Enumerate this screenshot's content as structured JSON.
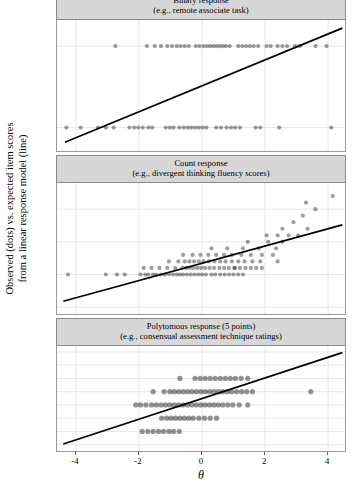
{
  "figure": {
    "ylabel": "Observed (dots) vs. expected item scores\nfrom a linear response model (line)",
    "xlabel": "θ"
  },
  "chart_data": [
    {
      "type": "scatter",
      "title": "Binary response",
      "subtitle": "(e.g., remote associate task)",
      "xlabel": "θ",
      "ylabel": "Observed (dots) vs. expected item scores from a linear response model (line)",
      "xlim": [
        -4.6,
        4.6
      ],
      "ylim": [
        -0.3,
        1.32
      ],
      "xticks": [
        -4,
        -2,
        0,
        2,
        4
      ],
      "yticks": [
        0,
        1
      ],
      "grid": true,
      "legend": "none",
      "line": {
        "name": "linear response model",
        "x": [
          -4.35,
          4.45
        ],
        "y": [
          -0.18,
          1.22
        ],
        "color": "#000000"
      },
      "points": [
        [
          -4.3,
          0
        ],
        [
          -3.85,
          0
        ],
        [
          -3.3,
          0
        ],
        [
          -3.05,
          0
        ],
        [
          -2.8,
          0
        ],
        [
          -2.3,
          0
        ],
        [
          -2.15,
          0
        ],
        [
          -2.02,
          0
        ],
        [
          -1.88,
          0
        ],
        [
          -1.7,
          0
        ],
        [
          -1.58,
          0
        ],
        [
          -1.15,
          0
        ],
        [
          -1.02,
          0
        ],
        [
          -0.9,
          0
        ],
        [
          -0.72,
          0
        ],
        [
          -0.58,
          0
        ],
        [
          -0.45,
          0
        ],
        [
          -0.34,
          0
        ],
        [
          -0.22,
          0
        ],
        [
          -0.1,
          0
        ],
        [
          0.02,
          0
        ],
        [
          0.14,
          0
        ],
        [
          0.45,
          0
        ],
        [
          0.6,
          0
        ],
        [
          0.78,
          0
        ],
        [
          0.92,
          0
        ],
        [
          1.05,
          0
        ],
        [
          1.2,
          0
        ],
        [
          1.7,
          0
        ],
        [
          1.85,
          0
        ],
        [
          2.45,
          0
        ],
        [
          4.1,
          0
        ],
        [
          -2.75,
          1
        ],
        [
          -1.75,
          1
        ],
        [
          -1.5,
          1
        ],
        [
          -1.3,
          1
        ],
        [
          -1.1,
          1
        ],
        [
          -0.95,
          1
        ],
        [
          -0.8,
          1
        ],
        [
          -0.68,
          1
        ],
        [
          -0.55,
          1
        ],
        [
          -0.42,
          1
        ],
        [
          -0.2,
          1
        ],
        [
          -0.08,
          1
        ],
        [
          0.05,
          1
        ],
        [
          0.16,
          1
        ],
        [
          0.26,
          1
        ],
        [
          0.36,
          1
        ],
        [
          0.46,
          1
        ],
        [
          0.56,
          1
        ],
        [
          0.66,
          1
        ],
        [
          0.76,
          1
        ],
        [
          0.88,
          1
        ],
        [
          1.15,
          1
        ],
        [
          1.28,
          1
        ],
        [
          1.4,
          1
        ],
        [
          1.52,
          1
        ],
        [
          1.64,
          1
        ],
        [
          1.78,
          1
        ],
        [
          2.05,
          1
        ],
        [
          2.18,
          1
        ],
        [
          2.4,
          1
        ],
        [
          2.55,
          1
        ],
        [
          2.7,
          1
        ],
        [
          2.95,
          1
        ],
        [
          3.1,
          1
        ],
        [
          3.6,
          1
        ],
        [
          3.95,
          1
        ]
      ]
    },
    {
      "type": "scatter",
      "title": "Count response",
      "subtitle": "(e.g., divergent thinking fluency scores)",
      "xlabel": "θ",
      "ylabel": "Observed (dots) vs. expected item scores from a linear response model (line)",
      "xlim": [
        -4.6,
        4.6
      ],
      "ylim": [
        -6.2,
        14.0
      ],
      "xticks": [
        -4,
        -2,
        0,
        2,
        4
      ],
      "yticks": [
        -5,
        0,
        5,
        10
      ],
      "grid": true,
      "legend": "none",
      "line": {
        "name": "linear response model",
        "x": [
          -4.4,
          4.45
        ],
        "y": [
          -4.1,
          7.6
        ],
        "color": "#000000"
      },
      "points": [
        [
          -4.25,
          0
        ],
        [
          -3.05,
          0
        ],
        [
          -2.7,
          0
        ],
        [
          -2.45,
          0
        ],
        [
          -1.95,
          0
        ],
        [
          -1.8,
          0
        ],
        [
          -1.7,
          0
        ],
        [
          -1.55,
          0
        ],
        [
          -1.45,
          0
        ],
        [
          -1.3,
          0
        ],
        [
          -1.18,
          0
        ],
        [
          -1.05,
          0
        ],
        [
          -0.92,
          0
        ],
        [
          -0.8,
          0
        ],
        [
          -0.7,
          0
        ],
        [
          -0.6,
          0
        ],
        [
          -0.48,
          0
        ],
        [
          -0.36,
          0
        ],
        [
          -0.24,
          0
        ],
        [
          -0.12,
          0
        ],
        [
          0.0,
          0
        ],
        [
          0.12,
          0
        ],
        [
          0.3,
          0
        ],
        [
          0.42,
          0
        ],
        [
          0.58,
          0
        ],
        [
          0.72,
          0
        ],
        [
          0.86,
          0
        ],
        [
          1.0,
          0
        ],
        [
          1.15,
          0
        ],
        [
          1.3,
          0
        ],
        [
          -1.85,
          1
        ],
        [
          -1.6,
          1
        ],
        [
          -1.35,
          1
        ],
        [
          -1.1,
          1
        ],
        [
          -0.85,
          1
        ],
        [
          -0.62,
          1
        ],
        [
          -0.5,
          1
        ],
        [
          -0.38,
          1
        ],
        [
          -0.26,
          1
        ],
        [
          -0.14,
          1
        ],
        [
          -0.02,
          1
        ],
        [
          0.1,
          1
        ],
        [
          0.24,
          1
        ],
        [
          0.38,
          1
        ],
        [
          0.55,
          1
        ],
        [
          0.7,
          1
        ],
        [
          0.85,
          1
        ],
        [
          1.02,
          1
        ],
        [
          1.2,
          1
        ],
        [
          1.38,
          1
        ],
        [
          1.55,
          1
        ],
        [
          1.72,
          1
        ],
        [
          1.9,
          1
        ],
        [
          -1.05,
          2
        ],
        [
          -0.75,
          2
        ],
        [
          -0.55,
          2
        ],
        [
          -0.4,
          2
        ],
        [
          -0.25,
          2
        ],
        [
          -0.1,
          2
        ],
        [
          0.05,
          2
        ],
        [
          0.22,
          2
        ],
        [
          0.4,
          2
        ],
        [
          0.58,
          2
        ],
        [
          0.75,
          2
        ],
        [
          0.95,
          2
        ],
        [
          1.15,
          2
        ],
        [
          1.35,
          2
        ],
        [
          1.6,
          2
        ],
        [
          1.85,
          2
        ],
        [
          -0.6,
          3
        ],
        [
          -0.3,
          3
        ],
        [
          -0.05,
          3
        ],
        [
          0.2,
          3
        ],
        [
          0.45,
          3
        ],
        [
          0.7,
          3
        ],
        [
          0.95,
          3
        ],
        [
          1.25,
          3
        ],
        [
          1.55,
          3
        ],
        [
          1.9,
          3
        ],
        [
          2.25,
          3
        ],
        [
          0.3,
          4
        ],
        [
          0.8,
          4
        ],
        [
          1.3,
          4
        ],
        [
          1.8,
          4
        ],
        [
          2.35,
          4
        ],
        [
          1.45,
          5
        ],
        [
          2.1,
          5
        ],
        [
          2.55,
          5
        ],
        [
          2.05,
          6
        ],
        [
          2.4,
          6
        ],
        [
          2.75,
          6
        ],
        [
          3.05,
          6
        ],
        [
          2.55,
          7
        ],
        [
          3.35,
          7
        ],
        [
          2.9,
          8
        ],
        [
          3.2,
          9
        ],
        [
          3.6,
          10
        ],
        [
          3.3,
          11
        ],
        [
          4.15,
          12
        ],
        [
          2.4,
          2
        ],
        [
          1.05,
          1
        ]
      ]
    },
    {
      "type": "scatter",
      "title": "Polytomous response (5 points)",
      "subtitle": "(e.g., consensual assessment technique ratings)",
      "xlabel": "θ",
      "ylabel": "Observed (dots) vs. expected item scores from a linear response model (line)",
      "xlim": [
        -4.6,
        4.6
      ],
      "ylim": [
        -0.55,
        7.45
      ],
      "xticks": [
        -4,
        -2,
        0,
        2,
        4
      ],
      "yticks": [
        0,
        1,
        2,
        3,
        4,
        5,
        6,
        7
      ],
      "grid": true,
      "legend": "none",
      "line": {
        "name": "linear response model",
        "x": [
          -4.4,
          4.45
        ],
        "y": [
          0.05,
          6.95
        ],
        "color": "#000000"
      },
      "points": [
        [
          -1.9,
          1
        ],
        [
          -1.72,
          1
        ],
        [
          -1.55,
          1
        ],
        [
          -1.38,
          1
        ],
        [
          -1.22,
          1
        ],
        [
          -1.05,
          1
        ],
        [
          -0.9,
          1
        ],
        [
          -0.72,
          1
        ],
        [
          -1.28,
          2
        ],
        [
          -1.12,
          2
        ],
        [
          -0.98,
          2
        ],
        [
          -0.84,
          2
        ],
        [
          -0.7,
          2
        ],
        [
          -0.56,
          2
        ],
        [
          -0.42,
          2
        ],
        [
          -0.28,
          2
        ],
        [
          -0.1,
          2
        ],
        [
          0.08,
          2
        ],
        [
          0.26,
          2
        ],
        [
          0.46,
          2
        ],
        [
          -2.1,
          3
        ],
        [
          -1.95,
          3
        ],
        [
          -1.78,
          3
        ],
        [
          -1.6,
          3
        ],
        [
          -1.45,
          3
        ],
        [
          -1.3,
          3
        ],
        [
          -1.16,
          3
        ],
        [
          -1.02,
          3
        ],
        [
          -0.88,
          3
        ],
        [
          -0.74,
          3
        ],
        [
          -0.6,
          3
        ],
        [
          -0.46,
          3
        ],
        [
          -0.32,
          3
        ],
        [
          -0.18,
          3
        ],
        [
          -0.04,
          3
        ],
        [
          0.1,
          3
        ],
        [
          0.24,
          3
        ],
        [
          0.38,
          3
        ],
        [
          0.52,
          3
        ],
        [
          0.66,
          3
        ],
        [
          0.82,
          3
        ],
        [
          0.98,
          3
        ],
        [
          1.18,
          3
        ],
        [
          1.45,
          3
        ],
        [
          -1.55,
          4
        ],
        [
          -1.2,
          4
        ],
        [
          -1.02,
          4
        ],
        [
          -0.88,
          4
        ],
        [
          -0.74,
          4
        ],
        [
          -0.6,
          4
        ],
        [
          -0.46,
          4
        ],
        [
          -0.32,
          4
        ],
        [
          -0.18,
          4
        ],
        [
          -0.04,
          4
        ],
        [
          0.1,
          4
        ],
        [
          0.24,
          4
        ],
        [
          0.38,
          4
        ],
        [
          0.52,
          4
        ],
        [
          0.66,
          4
        ],
        [
          0.8,
          4
        ],
        [
          0.94,
          4
        ],
        [
          1.1,
          4
        ],
        [
          1.26,
          4
        ],
        [
          1.42,
          4
        ],
        [
          1.6,
          4
        ],
        [
          3.45,
          4
        ],
        [
          -0.7,
          5
        ],
        [
          -0.22,
          5
        ],
        [
          -0.06,
          5
        ],
        [
          0.1,
          5
        ],
        [
          0.26,
          5
        ],
        [
          0.42,
          5
        ],
        [
          0.58,
          5
        ],
        [
          0.74,
          5
        ],
        [
          0.9,
          5
        ],
        [
          1.06,
          5
        ],
        [
          1.24,
          5
        ],
        [
          1.45,
          5
        ]
      ]
    }
  ]
}
